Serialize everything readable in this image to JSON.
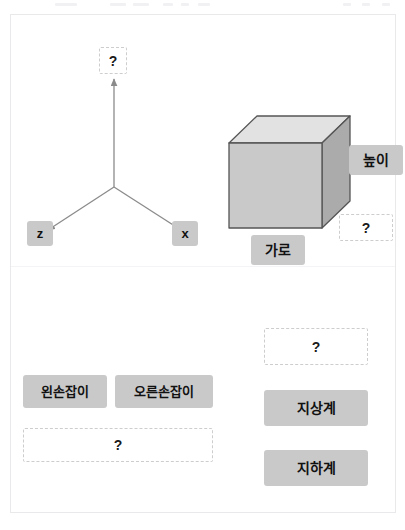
{
  "card": {
    "top_section": {
      "axes_diagram": {
        "name": "coordinate-axes",
        "y_axis_slot": "?",
        "z_axis_label": "z",
        "x_axis_label": "x"
      },
      "cube_diagram": {
        "name": "cuboid",
        "height_label": "높이",
        "width_label": "가로",
        "depth_slot": "?"
      }
    },
    "bottom_section": {
      "handedness_group": {
        "options": [
          {
            "label": "왼손잡이"
          },
          {
            "label": "오른손잡이"
          }
        ],
        "answer_slot": "?"
      },
      "system_group": {
        "answer_slot": "?",
        "options": [
          {
            "label": "지상계"
          },
          {
            "label": "지하계"
          }
        ]
      }
    }
  },
  "colors": {
    "chip_fill": "#c9c9c9",
    "slot_border": "#cdcdcd",
    "card_border": "#e9e9ec",
    "arrow_stroke": "#8b8b8b",
    "cube_top": "#e0e0e0",
    "cube_front": "#c8c8c8",
    "cube_side": "#aeaeae",
    "cube_stroke": "#555555"
  }
}
